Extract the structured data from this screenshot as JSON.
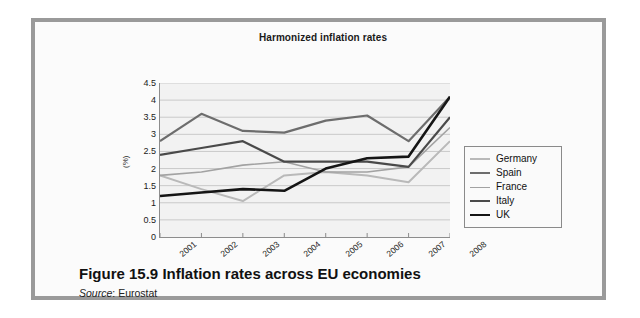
{
  "figure": {
    "caption_number": "Figure 15.9",
    "caption_text": "Inflation rates across EU economies",
    "source_label": "Source",
    "source_sep": ": ",
    "source_value": "Eurostat"
  },
  "legend": {
    "position": "right",
    "items": [
      {
        "label": "Germany",
        "color": "#b9b9b9",
        "width": "2px"
      },
      {
        "label": "Spain",
        "color": "#6d6d6d",
        "width": "2.2px"
      },
      {
        "label": "France",
        "color": "#a2a2a2",
        "width": "1.6px"
      },
      {
        "label": "Italy",
        "color": "#4a4a4a",
        "width": "2.2px"
      },
      {
        "label": "UK",
        "color": "#151515",
        "width": "2.6px"
      }
    ]
  },
  "chart_data": {
    "type": "line",
    "title": "Harmonized inflation rates",
    "xlabel": "",
    "ylabel": "(%)",
    "categories": [
      "2001",
      "2002",
      "2003",
      "2004",
      "2005",
      "2006",
      "2007",
      "2008"
    ],
    "ylim": [
      0,
      4.5
    ],
    "yticks": [
      0,
      0.5,
      1,
      1.5,
      2,
      2.5,
      3,
      3.5,
      4,
      4.5
    ],
    "ytick_labels": [
      "0",
      "0.5",
      "1",
      "1.5",
      "2",
      "2.5",
      "3",
      "3.5",
      "4",
      "4.5"
    ],
    "grid": true,
    "series": [
      {
        "name": "Germany",
        "color": "#b9b9b9",
        "width": 2.0,
        "values": [
          1.8,
          1.4,
          1.05,
          1.8,
          1.9,
          1.8,
          1.6,
          2.8
        ]
      },
      {
        "name": "Spain",
        "color": "#6d6d6d",
        "width": 2.2,
        "values": [
          2.8,
          3.6,
          3.1,
          3.05,
          3.4,
          3.55,
          2.8,
          4.1
        ]
      },
      {
        "name": "France",
        "color": "#a2a2a2",
        "width": 1.6,
        "values": [
          1.8,
          1.9,
          2.1,
          2.2,
          1.9,
          1.9,
          2.05,
          3.2
        ]
      },
      {
        "name": "Italy",
        "color": "#4a4a4a",
        "width": 2.2,
        "values": [
          2.4,
          2.6,
          2.8,
          2.2,
          2.2,
          2.2,
          2.05,
          3.5
        ]
      },
      {
        "name": "UK",
        "color": "#151515",
        "width": 2.6,
        "values": [
          1.2,
          1.3,
          1.4,
          1.35,
          2.0,
          2.3,
          2.35,
          4.1
        ]
      }
    ]
  }
}
